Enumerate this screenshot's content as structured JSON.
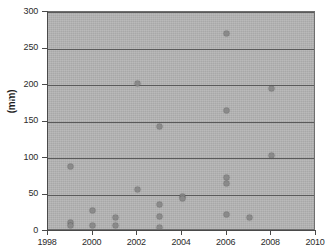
{
  "chart_data": {
    "type": "scatter",
    "title": "",
    "xlabel": "",
    "ylabel": "(mm)",
    "xlim": [
      1998,
      2010
    ],
    "ylim": [
      0,
      300
    ],
    "grid": true,
    "legend": false,
    "x_ticks": [
      1998,
      2000,
      2002,
      2004,
      2006,
      2008,
      2010
    ],
    "y_ticks": [
      0,
      50,
      100,
      150,
      200,
      250,
      300
    ],
    "x_tick_labels": [
      "1998",
      "2000",
      "2002",
      "2004",
      "2006",
      "2008",
      "2010"
    ],
    "y_tick_labels": [
      "0",
      "50",
      "100",
      "150",
      "200",
      "250",
      "300"
    ],
    "marker_color": "#8a8a8a",
    "plot_background_color": "#b4b4b4",
    "gridline_color": "#5a5a5a",
    "points": [
      {
        "x": 1999,
        "y": 88
      },
      {
        "x": 1999,
        "y": 12
      },
      {
        "x": 1999,
        "y": 8
      },
      {
        "x": 2000,
        "y": 28
      },
      {
        "x": 2000,
        "y": 8
      },
      {
        "x": 2001,
        "y": 19
      },
      {
        "x": 2001,
        "y": 8
      },
      {
        "x": 2002,
        "y": 202
      },
      {
        "x": 2002,
        "y": 57
      },
      {
        "x": 2003,
        "y": 143
      },
      {
        "x": 2003,
        "y": 36
      },
      {
        "x": 2003,
        "y": 20
      },
      {
        "x": 2003,
        "y": 5
      },
      {
        "x": 2004,
        "y": 48
      },
      {
        "x": 2004,
        "y": 45
      },
      {
        "x": 2006,
        "y": 270
      },
      {
        "x": 2006,
        "y": 165
      },
      {
        "x": 2006,
        "y": 73
      },
      {
        "x": 2006,
        "y": 65
      },
      {
        "x": 2006,
        "y": 22
      },
      {
        "x": 2007,
        "y": 19
      },
      {
        "x": 2008,
        "y": 195
      },
      {
        "x": 2008,
        "y": 104
      }
    ]
  }
}
